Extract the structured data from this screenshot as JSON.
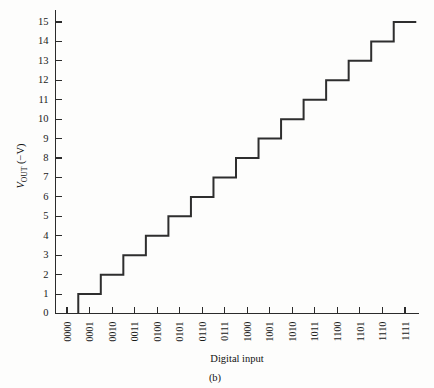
{
  "figure": {
    "caption": "(b)",
    "background_color": "#fdfdfc",
    "line_color": "#2e2e2e",
    "axis_color": "#2b2b2b"
  },
  "chart_data": {
    "type": "line",
    "title": "",
    "subtitle": "",
    "xlabel": "Digital input",
    "ylabel_main": "V",
    "ylabel_sub": "OUT",
    "ylabel_tail": " (−V)",
    "ylabel": "V_OUT (−V)",
    "categories": [
      "0000",
      "0001",
      "0010",
      "0011",
      "0100",
      "0101",
      "0110",
      "0111",
      "1000",
      "1001",
      "1010",
      "1011",
      "1100",
      "1101",
      "1110",
      "1111"
    ],
    "values": [
      0,
      1,
      2,
      3,
      4,
      5,
      6,
      7,
      8,
      9,
      10,
      11,
      12,
      13,
      14,
      15
    ],
    "x": [
      0,
      1,
      2,
      3,
      4,
      5,
      6,
      7,
      8,
      9,
      10,
      11,
      12,
      13,
      14,
      15
    ],
    "series": [
      {
        "name": "DAC staircase output",
        "values": [
          0,
          1,
          2,
          3,
          4,
          5,
          6,
          7,
          8,
          9,
          10,
          11,
          12,
          13,
          14,
          15
        ]
      }
    ],
    "step_shape": "mid",
    "ylim": [
      0,
      15
    ],
    "yticks": [
      0,
      1,
      2,
      3,
      4,
      5,
      6,
      7,
      8,
      9,
      10,
      11,
      12,
      13,
      14,
      15
    ],
    "ytick_labels": [
      "0",
      "1",
      "2",
      "3",
      "4",
      "5",
      "6",
      "7",
      "8",
      "9",
      "10",
      "11",
      "12",
      "13",
      "14",
      "15"
    ],
    "xlim": [
      -0.5,
      15.5
    ],
    "grid": false,
    "legend": "none",
    "annotations": []
  }
}
